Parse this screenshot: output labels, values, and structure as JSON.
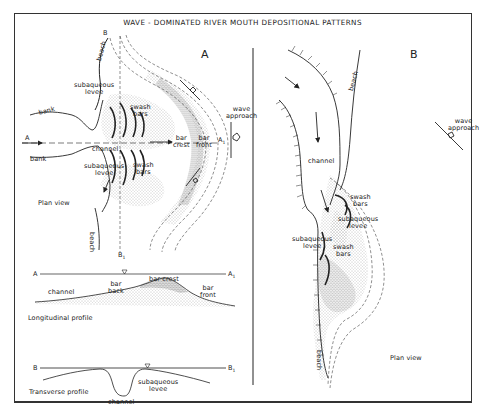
{
  "title": "WAVE - DOMINATED RIVER MOUTH DEPOSITIONAL PATTERNS",
  "panel_a": {
    "label": "A",
    "plan_view": {
      "caption": "Plan view",
      "labels": {
        "beach_top": "beach",
        "beach_bottom": "beach",
        "section_b": "B",
        "section_b1": "B",
        "section_b1_sub": "1",
        "section_a": "A",
        "section_a1": "A",
        "section_a1_sub": "1",
        "bank_top": "bank",
        "bank_bottom": "bank",
        "channel": "channel",
        "subaqueous_levee_top": [
          "subaqueous",
          "levee"
        ],
        "subaqueous_levee_bottom": [
          "subaqueous",
          "levee"
        ],
        "swash_bars_top": [
          "swash",
          "bars"
        ],
        "swash_bars_bottom": [
          "swash",
          "bars"
        ],
        "bar_crest": [
          "bar",
          "crest"
        ],
        "bar_front": [
          "bar",
          "front"
        ],
        "wave_approach": [
          "wave",
          "approach"
        ]
      }
    },
    "longitudinal_profile": {
      "caption": "Longitudinal profile",
      "start": "A",
      "end": "A",
      "end_sub": "1",
      "labels": {
        "channel": "channel",
        "bar_back": [
          "bar",
          "back"
        ],
        "bar_crest": "bar crest",
        "bar_front": [
          "bar",
          "front"
        ]
      },
      "water_level_symbol": "▽"
    },
    "transverse_profile": {
      "caption": "Transverse profile",
      "start": "B",
      "end": "B",
      "end_sub": "1",
      "labels": {
        "channel": "channel",
        "subaqueous_levee": [
          "subaqueous",
          "levee"
        ]
      },
      "water_level_symbol": "▽"
    }
  },
  "panel_b": {
    "label": "B",
    "plan_view": {
      "caption": "Plan view",
      "labels": {
        "beach_top": "beach",
        "beach_bottom": "beach",
        "channel": "channel",
        "swash_bars_upper": [
          "swash",
          "bars"
        ],
        "subaqueous_levee_upper": [
          "subaqueous",
          "levee"
        ],
        "subaqueous_levee_lower": [
          "subaqueous",
          "levee"
        ],
        "swash_bars_lower": [
          "swash",
          "bars"
        ],
        "wave_approach": [
          "wave",
          "approach"
        ]
      }
    }
  },
  "colors": {
    "ink": "#222222",
    "stipple": "#888888",
    "frame": "#333333"
  }
}
